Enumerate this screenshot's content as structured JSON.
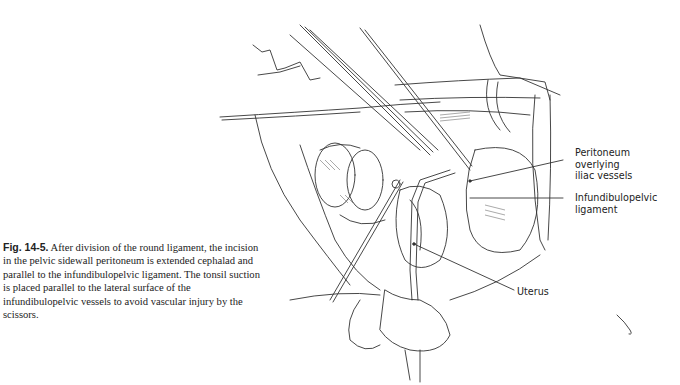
{
  "figure": {
    "number": "Fig. 14-5.",
    "caption": "After division of the round ligament, the incision in the pelvic sidewall peritoneum is extended cephalad and parallel to the infundibulopelvic ligament. The tonsil suction is placed parallel to the lateral surface of the infundibulopelvic vessels to avoid vascular injury by the scissors.",
    "illustration": "surgical-line-drawing-pelvic-sidewall-dissection",
    "labels": [
      {
        "id": "peritoneum",
        "lines": [
          "Peritoneum",
          "overlying",
          "iliac vessels"
        ]
      },
      {
        "id": "infundibulopelvic",
        "lines": [
          "Infundibulopelvic",
          "ligament"
        ]
      },
      {
        "id": "uterus",
        "lines": [
          "Uterus"
        ]
      }
    ]
  }
}
